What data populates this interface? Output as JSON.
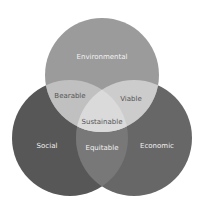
{
  "diagram": {
    "type": "venn",
    "circles": {
      "environmental": {
        "label": "Environmental",
        "color": "#9a9a9a"
      },
      "social": {
        "label": "Social",
        "color": "#575757"
      },
      "economic": {
        "label": "Economic",
        "color": "#6a6a6a"
      }
    },
    "intersections": {
      "bearable": "Bearable",
      "viable": "Viable",
      "equitable": "Equitable",
      "sustainable": "Sustainable"
    },
    "colors": {
      "bearable_fill": "#c2c2c2",
      "viable_fill": "#cfcfcf",
      "equitable_fill": "#7a7a7a",
      "sustainable_fill": "#dcdcdc",
      "light_text": "#f2f2f2",
      "dark_text": "#555555"
    }
  }
}
